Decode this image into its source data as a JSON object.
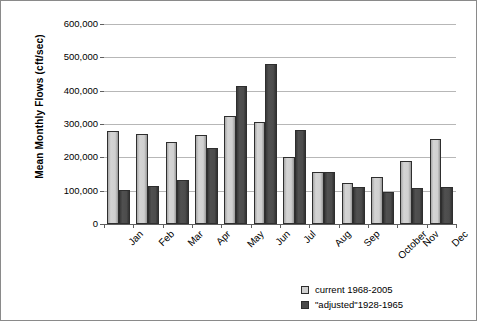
{
  "chart_data": {
    "type": "bar",
    "title": "",
    "xlabel": "",
    "ylabel": "Mean Monthly Flows (cft/sec)",
    "ylim": [
      0,
      600000
    ],
    "ytick_labels": [
      "600,000",
      "500,000",
      "400,000",
      "300,000",
      "200,000",
      "100,000",
      "0"
    ],
    "ytick_values": [
      600000,
      500000,
      400000,
      300000,
      200000,
      100000,
      0
    ],
    "grid": true,
    "legend_position": "bottom-right",
    "categories": [
      "Jan",
      "Feb",
      "Mar",
      "Apr",
      "May",
      "Jun",
      "Jul",
      "Aug",
      "Sep",
      "October",
      "Nov",
      "Dec"
    ],
    "series": [
      {
        "name": "current 1968-2005",
        "color": "#d0d0d0",
        "values": [
          278000,
          270000,
          246000,
          267000,
          324000,
          307000,
          202000,
          155000,
          124000,
          141000,
          188000,
          256000
        ]
      },
      {
        "name": "\"adjusted\"1928-1965",
        "color": "#4a4a4a",
        "values": [
          103000,
          115000,
          131000,
          228000,
          414000,
          479000,
          282000,
          155000,
          110000,
          97000,
          107000,
          112000
        ]
      }
    ]
  },
  "legend": {
    "items": [
      {
        "label": "current 1968-2005"
      },
      {
        "label": "\"adjusted\"1928-1965"
      }
    ]
  }
}
